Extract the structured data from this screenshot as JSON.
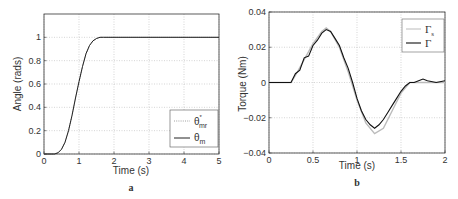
{
  "chart_data": [
    {
      "type": "line",
      "panel_label": "a",
      "title": "",
      "xlabel": "Time (s)",
      "ylabel": "Angle (rads)",
      "xlim": [
        0,
        5
      ],
      "ylim": [
        0,
        1.2
      ],
      "xticks": [
        "0",
        "1",
        "2",
        "3",
        "4",
        "5"
      ],
      "yticks": [
        "0",
        "0.2",
        "0.4",
        "0.6",
        "0.8",
        "1"
      ],
      "grid": true,
      "legend_position": "lower right",
      "series": [
        {
          "name": "θ*mr",
          "style": "dotted",
          "x": [
            0,
            0.3,
            0.4,
            0.5,
            0.6,
            0.7,
            0.8,
            0.9,
            1.0,
            1.1,
            1.2,
            1.3,
            1.4,
            1.5,
            1.6,
            1.7,
            2.0,
            3.0,
            4.0,
            5.0
          ],
          "y": [
            0,
            0,
            0.01,
            0.04,
            0.1,
            0.2,
            0.33,
            0.48,
            0.62,
            0.75,
            0.86,
            0.93,
            0.97,
            0.99,
            1.0,
            1.0,
            1.0,
            1.0,
            1.0,
            1.0
          ]
        },
        {
          "name": "θm",
          "style": "solid",
          "x": [
            0,
            0.3,
            0.4,
            0.5,
            0.6,
            0.7,
            0.8,
            0.9,
            1.0,
            1.1,
            1.2,
            1.3,
            1.4,
            1.5,
            1.6,
            1.7,
            2.0,
            3.0,
            4.0,
            5.0
          ],
          "y": [
            0,
            0,
            0.01,
            0.04,
            0.1,
            0.2,
            0.33,
            0.48,
            0.62,
            0.75,
            0.86,
            0.93,
            0.97,
            0.99,
            1.0,
            1.0,
            1.0,
            1.0,
            1.0,
            1.0
          ]
        }
      ]
    },
    {
      "type": "line",
      "panel_label": "b",
      "title": "",
      "xlabel": "Time (s)",
      "ylabel": "Torque (Nm)",
      "xlim": [
        0,
        2
      ],
      "ylim": [
        -0.04,
        0.04
      ],
      "xticks": [
        "0",
        "0.5",
        "1",
        "1.5",
        "2"
      ],
      "yticks": [
        "-0.04",
        "-0.02",
        "0",
        "0.02",
        "0.04"
      ],
      "grid": true,
      "legend_position": "upper right",
      "series": [
        {
          "name": "Γs",
          "style": "solid light gray",
          "x": [
            0,
            0.25,
            0.3,
            0.4,
            0.5,
            0.6,
            0.65,
            0.7,
            0.8,
            0.9,
            1.0,
            1.1,
            1.2,
            1.3,
            1.4,
            1.5,
            1.6,
            1.7,
            1.8,
            2.0
          ],
          "y": [
            0,
            0,
            0.004,
            0.013,
            0.022,
            0.029,
            0.031,
            0.029,
            0.02,
            0.006,
            -0.01,
            -0.023,
            -0.029,
            -0.026,
            -0.016,
            -0.006,
            0,
            0,
            0,
            0
          ]
        },
        {
          "name": "Γ",
          "style": "solid black",
          "x": [
            0,
            0.25,
            0.3,
            0.35,
            0.4,
            0.45,
            0.5,
            0.55,
            0.6,
            0.65,
            0.7,
            0.75,
            0.8,
            0.85,
            0.9,
            0.95,
            1.0,
            1.05,
            1.1,
            1.15,
            1.2,
            1.25,
            1.3,
            1.35,
            1.4,
            1.45,
            1.5,
            1.55,
            1.6,
            1.65,
            1.7,
            1.75,
            1.8,
            1.9,
            2.0
          ],
          "y": [
            0,
            0,
            0.005,
            0.007,
            0.014,
            0.015,
            0.021,
            0.024,
            0.028,
            0.03,
            0.029,
            0.025,
            0.021,
            0.014,
            0.008,
            0.0,
            -0.009,
            -0.016,
            -0.021,
            -0.024,
            -0.026,
            -0.024,
            -0.021,
            -0.017,
            -0.013,
            -0.009,
            -0.005,
            -0.002,
            0.0,
            0.0,
            0.001,
            0.002,
            0.001,
            0.0,
            0.001
          ]
        }
      ]
    }
  ],
  "panels": {
    "a": {
      "label": "a",
      "xlabel": "Time (s)",
      "ylabel": "Angle (rads)",
      "legend": [
        {
          "symbol": "θ",
          "sup": "*",
          "sub": "mr"
        },
        {
          "symbol": "θ",
          "sup": "",
          "sub": "m"
        }
      ]
    },
    "b": {
      "label": "b",
      "xlabel": "Time (s)",
      "ylabel": "Torque (Nm)",
      "legend": [
        {
          "symbol": "Γ",
          "sub": "s"
        },
        {
          "symbol": "Γ",
          "sub": ""
        }
      ]
    }
  },
  "colors": {
    "axis": "#333333",
    "grid": "#bbbbbb",
    "series_a_ref": "#888888",
    "series_a_meas": "#222222",
    "series_b_ref": "#bbbbbb",
    "series_b_meas": "#111111"
  }
}
